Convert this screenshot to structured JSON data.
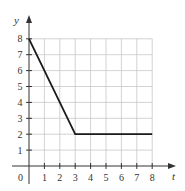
{
  "chart_data": {
    "type": "line",
    "title": "",
    "xlabel": "t",
    "ylabel": "y",
    "origin_label": "0",
    "x_ticks": [
      "1",
      "2",
      "3",
      "4",
      "5",
      "6",
      "7",
      "8"
    ],
    "y_ticks": [
      "1",
      "2",
      "3",
      "4",
      "5",
      "6",
      "7",
      "8"
    ],
    "xlim": [
      0,
      8
    ],
    "ylim": [
      0,
      8
    ],
    "grid": true,
    "legend": null,
    "series": [
      {
        "name": "y(t)",
        "x": [
          0,
          3,
          8
        ],
        "y": [
          8,
          2,
          2
        ]
      }
    ]
  },
  "colors": {
    "grid": "#c8c8c8",
    "axis": "#333333",
    "line": "#1a1a1a",
    "background": "#ffffff"
  }
}
